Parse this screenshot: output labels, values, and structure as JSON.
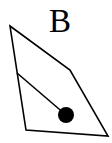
{
  "figure": {
    "label": "B",
    "stroke_color": "#000000",
    "fill_color": "#000000",
    "background": "#ffffff",
    "quadrilateral": {
      "points": [
        [
          10,
          26
        ],
        [
          70,
          70
        ],
        [
          108,
          136
        ],
        [
          26,
          130
        ]
      ]
    },
    "inner_line": {
      "x1": 17,
      "y1": 73,
      "x2": 66,
      "y2": 115
    },
    "dot": {
      "cx": 66,
      "cy": 115,
      "r": 8
    }
  }
}
